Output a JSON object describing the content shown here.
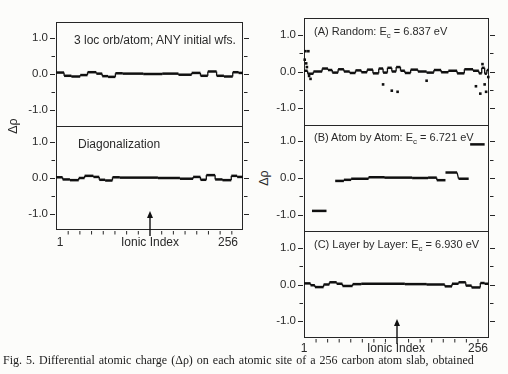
{
  "figure": {
    "caption": "Fig. 5. Differential atomic charge (Δρ) on each atomic site of a 256 carbon atom slab, obtained"
  },
  "left_column": {
    "ylabel": "Δρ",
    "xlabel": "Ionic Index",
    "x_first": "1",
    "x_last": "256",
    "panels": [
      {
        "title": "3 loc orb/atom; ANY initial wfs."
      },
      {
        "title": "Diagonalization"
      }
    ]
  },
  "right_column": {
    "ylabel": "Δρ",
    "xlabel": "Ionic Index",
    "x_first": "1",
    "x_last": "256",
    "panels": [
      {
        "title_prefix": "(A) Random: E",
        "title_sub": "c",
        "title_suffix": " = 6.837 eV"
      },
      {
        "title_prefix": "(B) Atom by Atom: E",
        "title_sub": "c",
        "title_suffix": " = 6.721 eV"
      },
      {
        "title_prefix": "(C) Layer by Layer: E",
        "title_sub": "c",
        "title_suffix": " = 6.930 eV"
      }
    ]
  },
  "chart_data": [
    {
      "id": "left-top",
      "type": "scatter",
      "title": "3 loc orb/atom; ANY initial wfs.",
      "xlabel": "Ionic Index",
      "ylabel": "Δρ",
      "xlim": [
        1,
        256
      ],
      "ylim": [
        -1.45,
        1.45
      ],
      "xtick_labels": [
        "1",
        "256"
      ],
      "ytick_values": [
        1.0,
        0.0,
        -1.0
      ],
      "ytick_labels": [
        "1.0",
        "0.0",
        "-1.0"
      ],
      "ytick_minor": [
        0.5,
        -0.5
      ],
      "segments": [
        [
          1,
          12,
          0.04
        ],
        [
          12,
          22,
          -0.05
        ],
        [
          22,
          34,
          -0.07
        ],
        [
          34,
          44,
          -0.03
        ],
        [
          44,
          56,
          0.05
        ],
        [
          56,
          64,
          0.01
        ],
        [
          64,
          72,
          -0.06
        ],
        [
          72,
          82,
          -0.08
        ],
        [
          82,
          92,
          0.02
        ],
        [
          92,
          120,
          0.01
        ],
        [
          120,
          146,
          0.0
        ],
        [
          146,
          168,
          0.01
        ],
        [
          168,
          186,
          -0.02
        ],
        [
          186,
          198,
          0.03
        ],
        [
          198,
          208,
          -0.05
        ],
        [
          208,
          220,
          0.07
        ],
        [
          220,
          230,
          -0.05
        ],
        [
          230,
          242,
          -0.07
        ],
        [
          242,
          250,
          0.05
        ],
        [
          250,
          256,
          0.03
        ]
      ],
      "points": []
    },
    {
      "id": "left-bottom",
      "type": "scatter",
      "title": "Diagonalization",
      "xlabel": "Ionic Index",
      "ylabel": "Δρ",
      "xlim": [
        1,
        256
      ],
      "ylim": [
        -1.45,
        1.45
      ],
      "xtick_labels": [
        "1",
        "256"
      ],
      "ytick_values": [
        1.0,
        0.0,
        -1.0
      ],
      "ytick_labels": [
        "1.0",
        "0.0",
        "-1.0"
      ],
      "ytick_minor": [
        0.5,
        -0.5
      ],
      "segments": [
        [
          1,
          10,
          0.02
        ],
        [
          10,
          20,
          -0.04
        ],
        [
          20,
          32,
          -0.06
        ],
        [
          32,
          40,
          0.0
        ],
        [
          40,
          52,
          0.06
        ],
        [
          52,
          60,
          0.03
        ],
        [
          60,
          68,
          -0.05
        ],
        [
          68,
          78,
          -0.07
        ],
        [
          78,
          88,
          0.02
        ],
        [
          88,
          140,
          0.01
        ],
        [
          140,
          170,
          0.0
        ],
        [
          170,
          188,
          -0.02
        ],
        [
          188,
          198,
          0.03
        ],
        [
          198,
          206,
          -0.05
        ],
        [
          206,
          218,
          0.08
        ],
        [
          218,
          228,
          -0.04
        ],
        [
          228,
          240,
          -0.06
        ],
        [
          240,
          248,
          0.06
        ],
        [
          248,
          256,
          0.03
        ]
      ],
      "points": []
    },
    {
      "id": "panel-a",
      "type": "scatter",
      "title": "(A) Random: Ec = 6.837 eV",
      "xlabel": "Ionic Index",
      "ylabel": "Δρ",
      "xlim": [
        1,
        256
      ],
      "ylim": [
        -1.45,
        1.45
      ],
      "xtick_labels": [
        "1",
        "256"
      ],
      "ytick_values": [
        1.0,
        0.0,
        -1.0
      ],
      "ytick_labels": [
        "1.0",
        "0.0",
        "-1.0"
      ],
      "ytick_minor": [
        0.5,
        -0.5
      ],
      "segments": [
        [
          1,
          6,
          0.02
        ],
        [
          6,
          14,
          -0.06
        ],
        [
          14,
          26,
          0.0
        ],
        [
          26,
          34,
          0.08
        ],
        [
          34,
          40,
          0.04
        ],
        [
          40,
          48,
          -0.03
        ],
        [
          48,
          56,
          0.06
        ],
        [
          56,
          64,
          0.0
        ],
        [
          64,
          72,
          -0.04
        ],
        [
          72,
          80,
          0.03
        ],
        [
          80,
          88,
          -0.02
        ],
        [
          88,
          96,
          0.05
        ],
        [
          96,
          104,
          -0.05
        ],
        [
          104,
          110,
          0.08
        ],
        [
          110,
          116,
          -0.03
        ],
        [
          116,
          122,
          0.1
        ],
        [
          122,
          128,
          0.0
        ],
        [
          128,
          134,
          0.12
        ],
        [
          134,
          140,
          0.02
        ],
        [
          140,
          148,
          -0.04
        ],
        [
          148,
          158,
          0.05
        ],
        [
          158,
          170,
          0.0
        ],
        [
          170,
          180,
          -0.03
        ],
        [
          180,
          190,
          0.04
        ],
        [
          190,
          200,
          -0.02
        ],
        [
          200,
          212,
          0.02
        ],
        [
          212,
          222,
          -0.05
        ],
        [
          222,
          234,
          0.06
        ],
        [
          234,
          242,
          0.02
        ],
        [
          242,
          246,
          -0.05
        ],
        [
          246,
          250,
          0.1
        ],
        [
          250,
          253,
          -0.06
        ],
        [
          253,
          256,
          0.04
        ]
      ],
      "points": [
        [
          3,
          0.55
        ],
        [
          7,
          0.55
        ],
        [
          2,
          0.32
        ],
        [
          4,
          0.22
        ],
        [
          5,
          0.12
        ],
        [
          8,
          -0.12
        ],
        [
          10,
          -0.2
        ],
        [
          110,
          -0.35
        ],
        [
          122,
          -0.52
        ],
        [
          130,
          -0.55
        ],
        [
          170,
          -0.25
        ],
        [
          238,
          -0.4
        ],
        [
          244,
          -0.6
        ],
        [
          250,
          -0.35
        ],
        [
          252,
          -0.55
        ],
        [
          247,
          0.2
        ],
        [
          255,
          -0.15
        ]
      ]
    },
    {
      "id": "panel-b",
      "type": "scatter",
      "title": "(B) Atom by Atom: Ec = 6.721 eV",
      "xlabel": "Ionic Index",
      "ylabel": "Δρ",
      "xlim": [
        1,
        256
      ],
      "ylim": [
        -1.45,
        1.45
      ],
      "xtick_labels": [
        "1",
        "256"
      ],
      "ytick_values": [
        1.0,
        0.0,
        -1.0
      ],
      "ytick_labels": [
        "1.0",
        "0.0",
        "-1.0"
      ],
      "ytick_minor": [
        0.5,
        -0.5
      ],
      "segments": [
        [
          12,
          32,
          -0.9
        ],
        [
          44,
          56,
          -0.08
        ],
        [
          56,
          66,
          -0.05
        ],
        [
          66,
          90,
          -0.02
        ],
        [
          90,
          112,
          0.02
        ],
        [
          112,
          150,
          0.01
        ],
        [
          150,
          172,
          0.0
        ],
        [
          172,
          184,
          0.01
        ],
        [
          184,
          196,
          -0.06
        ],
        [
          196,
          212,
          0.15
        ],
        [
          214,
          228,
          -0.02
        ],
        [
          230,
          250,
          0.92
        ]
      ],
      "points": []
    },
    {
      "id": "panel-c",
      "type": "scatter",
      "title": "(C) Layer by Layer: Ec = 6.930 eV",
      "xlabel": "Ionic Index",
      "ylabel": "Δρ",
      "xlim": [
        1,
        256
      ],
      "ylim": [
        -1.45,
        1.45
      ],
      "xtick_labels": [
        "1",
        "256"
      ],
      "ytick_values": [
        1.0,
        0.0,
        -1.0
      ],
      "ytick_labels": [
        "1.0",
        "0.0",
        "-1.0"
      ],
      "ytick_minor": [
        0.5,
        -0.5
      ],
      "segments": [
        [
          1,
          10,
          0.03
        ],
        [
          10,
          16,
          -0.02
        ],
        [
          16,
          28,
          -0.07
        ],
        [
          28,
          36,
          0.0
        ],
        [
          36,
          46,
          0.06
        ],
        [
          46,
          54,
          0.02
        ],
        [
          54,
          68,
          -0.04
        ],
        [
          68,
          80,
          0.01
        ],
        [
          80,
          140,
          0.02
        ],
        [
          140,
          170,
          0.01
        ],
        [
          170,
          195,
          0.0
        ],
        [
          195,
          205,
          -0.05
        ],
        [
          205,
          214,
          0.02
        ],
        [
          214,
          224,
          0.06
        ],
        [
          224,
          232,
          -0.03
        ],
        [
          232,
          244,
          -0.08
        ],
        [
          244,
          250,
          0.04
        ],
        [
          250,
          256,
          0.02
        ]
      ],
      "points": []
    }
  ]
}
